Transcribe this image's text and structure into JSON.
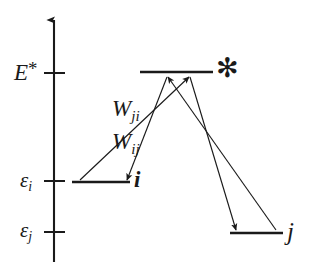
{
  "diagram": {
    "type": "energy-level-diagram",
    "axis": {
      "name": "energy-axis",
      "orientation": "vertical",
      "arrow_at_top": true,
      "x": 54,
      "top_y": 18,
      "bottom_y": 262
    },
    "colors": {
      "stroke": "#1a1a1a",
      "text": "#1a1a1a",
      "background": "#ffffff"
    },
    "axis_ticks": [
      {
        "label_id": "E-star",
        "text": "E",
        "superscript": "*",
        "y": 73
      },
      {
        "label_id": "eps-i",
        "text": "ε",
        "subscript": "i",
        "y": 181
      },
      {
        "label_id": "eps-j",
        "text": "ε",
        "subscript": "j",
        "y": 232
      }
    ],
    "labels": {
      "energy_star": {
        "base": "E",
        "sup": "*"
      },
      "epsilon_i": {
        "base": "ε",
        "sub": "i"
      },
      "epsilon_j": {
        "base": "ε",
        "sub": "j"
      },
      "rate_ji": {
        "base": "W",
        "sub": "ji"
      },
      "rate_ij": {
        "base": "W",
        "sub": "ij"
      },
      "state_i": "i",
      "state_j": "j",
      "excited_state": "✻"
    },
    "levels": [
      {
        "name": "excited-level",
        "id": "star",
        "x1": 140,
        "x2": 213,
        "y": 72
      },
      {
        "name": "level-i",
        "id": "i",
        "x1": 72,
        "x2": 130,
        "y": 182
      },
      {
        "name": "level-j",
        "id": "j",
        "x1": 230,
        "x2": 283,
        "y": 233
      }
    ],
    "transitions": [
      {
        "name": "excitation-from-i",
        "from": "i",
        "to": "excited",
        "direction": "up",
        "x1": 80,
        "y1": 180,
        "x2": 190,
        "y2": 76
      },
      {
        "name": "relaxation-to-j",
        "from": "excited",
        "to": "j",
        "direction": "down",
        "x1": 190,
        "y1": 76,
        "x2": 236,
        "y2": 230
      },
      {
        "name": "excitation-from-j",
        "from": "j",
        "to": "excited",
        "direction": "up",
        "x1": 276,
        "y1": 230,
        "x2": 167,
        "y2": 76
      },
      {
        "name": "relaxation-to-i",
        "from": "excited",
        "to": "i",
        "direction": "down",
        "x1": 167,
        "y1": 76,
        "x2": 126,
        "y2": 180
      }
    ]
  }
}
